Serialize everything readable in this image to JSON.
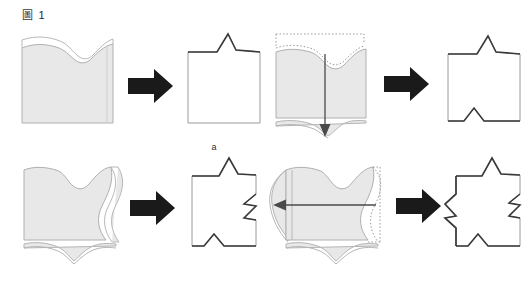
{
  "figure": {
    "caption_cjk": "圖",
    "caption_number": "1",
    "background_color": "#ffffff"
  },
  "style": {
    "shape_fill": "#e8e8e8",
    "shape_stroke": "#9a9a9a",
    "shape_stroke_light": "#b5b5b5",
    "result_stroke": "#8c8c8c",
    "emphasis_stroke": "#3a3a3a",
    "arrow_fill": "#1a1a1a",
    "dotted_stroke": "#8c8c8c",
    "motion_arrow_stroke": "#4a4a4a",
    "label_color": "#2b2b2b"
  },
  "panels": [
    {
      "id": "a",
      "label": "a",
      "input_name": "gray-sheet-with-top-notch",
      "operation": "transform-arrow-right",
      "result_name": "square-with-peaked-top-edge",
      "emphasized_edges": [
        "top"
      ],
      "arrow_direction": "right",
      "has_dotted_outline": false,
      "has_motion_arrow": false
    },
    {
      "id": "b",
      "label": "b",
      "input_name": "gray-sheet-with-top-notch-and-downward-motion",
      "operation": "transform-arrow-right",
      "result_name": "square-with-peaked-top-and-bottom-notch",
      "emphasized_edges": [
        "top",
        "bottom"
      ],
      "arrow_direction": "right",
      "has_dotted_outline": true,
      "has_motion_arrow": true,
      "motion_arrow_direction": "down"
    },
    {
      "id": "c",
      "label": "c",
      "input_name": "gray-sheet-with-top-notch-and-wavy-right-edge",
      "operation": "transform-arrow-right",
      "result_name": "square-with-peaks-and-right-zigzag",
      "emphasized_edges": [
        "top",
        "bottom",
        "right"
      ],
      "arrow_direction": "right",
      "has_dotted_outline": false,
      "has_motion_arrow": false
    },
    {
      "id": "d",
      "label": "d",
      "input_name": "gray-sheet-with-wavy-edges-and-leftward-motion",
      "operation": "transform-arrow-right",
      "result_name": "square-with-zigzags-on-both-sides",
      "emphasized_edges": [
        "top",
        "bottom",
        "left",
        "right"
      ],
      "arrow_direction": "right",
      "has_dotted_outline": true,
      "has_motion_arrow": true,
      "motion_arrow_direction": "left"
    }
  ]
}
